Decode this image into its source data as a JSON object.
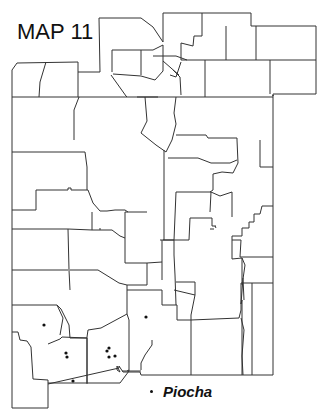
{
  "map": {
    "title": "MAP 11",
    "region": "county outline map",
    "line_color": "#333333",
    "background": "#ffffff"
  },
  "legend": {
    "items": [
      {
        "symbol": "dot",
        "label": "Piocha"
      }
    ]
  },
  "points": [
    {
      "x": 44,
      "y": 325
    },
    {
      "x": 66,
      "y": 353
    },
    {
      "x": 67,
      "y": 357
    },
    {
      "x": 73,
      "y": 381
    },
    {
      "x": 107,
      "y": 351
    },
    {
      "x": 109,
      "y": 348
    },
    {
      "x": 109,
      "y": 357
    },
    {
      "x": 115,
      "y": 356
    },
    {
      "x": 146,
      "y": 317
    },
    {
      "x": 153,
      "y": 392
    }
  ]
}
